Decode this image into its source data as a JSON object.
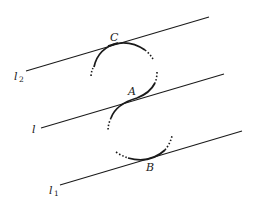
{
  "diagram": {
    "title": "",
    "colors": {
      "stroke": "#1a1a1a",
      "background": "#ffffff"
    },
    "lines": [
      {
        "id": "l2",
        "label": "l",
        "subscript": "2",
        "x1": 26,
        "y1": 71,
        "x2": 209,
        "y2": 17
      },
      {
        "id": "l",
        "label": "l",
        "subscript": "",
        "x1": 41,
        "y1": 128,
        "x2": 224,
        "y2": 74
      },
      {
        "id": "l1",
        "label": "l",
        "subscript": "1",
        "x1": 60,
        "y1": 185,
        "x2": 242,
        "y2": 131
      }
    ],
    "points": [
      {
        "id": "C",
        "label": "C"
      },
      {
        "id": "A",
        "label": "A"
      },
      {
        "id": "B",
        "label": "B"
      }
    ],
    "arcs": [
      {
        "id": "upper-arc",
        "description": "circle arc tangent to l2 at C and to l at A"
      },
      {
        "id": "lower-arc",
        "description": "circle arc tangent to l at A and to l1 at B"
      }
    ]
  }
}
